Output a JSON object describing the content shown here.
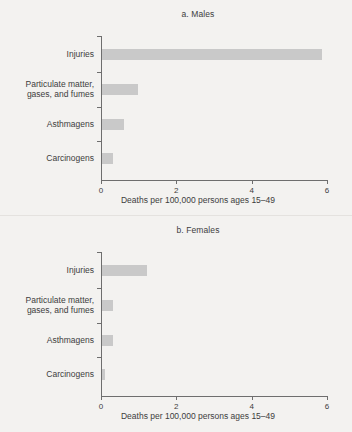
{
  "figure": {
    "background_color": "#f3f2f0",
    "bar_color": "#c9c9c9",
    "axis_color": "#6e6e6e",
    "text_color": "#3d3d3d"
  },
  "chart_data": [
    {
      "type": "bar",
      "orientation": "horizontal",
      "title": "a. Males",
      "categories": [
        "Injuries",
        "Particulate matter, gases, and fumes",
        "Asthmagens",
        "Carcinogens"
      ],
      "category_lines": [
        [
          "Injuries"
        ],
        [
          "Particulate matter,",
          "gases, and fumes"
        ],
        [
          "Asthmagens"
        ],
        [
          "Carcinogens"
        ]
      ],
      "values": [
        5.85,
        0.95,
        0.58,
        0.28
      ],
      "xlabel": "Deaths per 100,000 persons ages 15–49",
      "ylabel": "",
      "xlim": [
        0,
        6
      ],
      "xticks": [
        0,
        2,
        4,
        6
      ],
      "xticklabels": [
        "0",
        "2",
        "4",
        "6"
      ],
      "grid": false,
      "legend": false
    },
    {
      "type": "bar",
      "orientation": "horizontal",
      "title": "b. Females",
      "categories": [
        "Injuries",
        "Particulate matter, gases, and fumes",
        "Asthmagens",
        "Carcinogens"
      ],
      "category_lines": [
        [
          "Injuries"
        ],
        [
          "Particulate matter,",
          "gases, and fumes"
        ],
        [
          "Asthmagens"
        ],
        [
          "Carcinogens"
        ]
      ],
      "values": [
        1.2,
        0.28,
        0.28,
        0.08
      ],
      "xlabel": "Deaths per 100,000 persons ages 15–49",
      "ylabel": "",
      "xlim": [
        0,
        6
      ],
      "xticks": [
        0,
        2,
        4,
        6
      ],
      "xticklabels": [
        "0",
        "2",
        "4",
        "6"
      ],
      "grid": false,
      "legend": false
    }
  ]
}
